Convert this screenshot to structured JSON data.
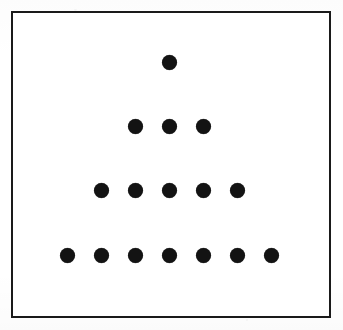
{
  "figure": {
    "title": "Triangular dot array",
    "description": "A solid black rectangular frame enclosing a centered triangular arrangement of filled black circles."
  },
  "canvas": {
    "width": 343,
    "height": 330,
    "background_color": "#ffffff"
  },
  "frame": {
    "name": "rectangular-border",
    "x": 11,
    "y": 11,
    "width": 320,
    "height": 307,
    "border_width": 2,
    "border_color": "#1a1a1a",
    "fill_color": "#ffffff"
  },
  "chart_data": {
    "type": "scatter",
    "title": "Triangular dot array",
    "xlabel": "",
    "ylabel": "",
    "xlim": [
      11,
      331
    ],
    "ylim": [
      11,
      318
    ],
    "grid": false,
    "legend": "none",
    "marker": {
      "shape": "circle",
      "filled": true,
      "color": "#131313",
      "diameter_px": 15
    },
    "row_counts": [
      1,
      3,
      5,
      7
    ],
    "total_dots": 16,
    "row_spacing_px": 64,
    "column_spacing_px": 34,
    "center_x": 169,
    "rows": [
      {
        "index": 1,
        "label": "row-1",
        "count": 1,
        "y": 62,
        "x": [
          169
        ]
      },
      {
        "index": 2,
        "label": "row-2",
        "count": 3,
        "y": 126,
        "x": [
          135,
          169,
          203
        ]
      },
      {
        "index": 3,
        "label": "row-3",
        "count": 5,
        "y": 190,
        "x": [
          101,
          135,
          169,
          203,
          237
        ]
      },
      {
        "index": 4,
        "label": "row-4",
        "count": 7,
        "y": 255,
        "x": [
          67,
          101,
          135,
          169,
          203,
          237,
          271
        ]
      }
    ]
  },
  "colors": {
    "ink": "#131313",
    "frame": "#1a1a1a",
    "paper": "#ffffff"
  }
}
